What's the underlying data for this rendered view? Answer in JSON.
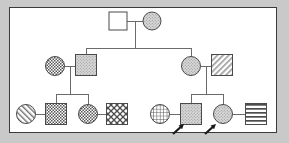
{
  "diagram": {
    "type": "pedigree-chart",
    "border_color": "#3a3a3a",
    "background_color": "#ffffff",
    "page_background": "#c9c9c9",
    "line_color": "#6b6b6b",
    "symbol_stroke": "#4a4a4a",
    "arrow_color": "#1a1a1a",
    "generations": 3,
    "legend_note": "",
    "symbols": [
      {
        "id": "I-1",
        "shape": "square",
        "sex": "male",
        "fill": "blank",
        "cx": 118,
        "cy": 21,
        "size": 18,
        "generation": 1,
        "proband": false
      },
      {
        "id": "I-2",
        "shape": "circle",
        "sex": "female",
        "fill": "stipple",
        "cx": 152,
        "cy": 21,
        "size": 18,
        "generation": 1,
        "proband": false
      },
      {
        "id": "II-1",
        "shape": "circle",
        "sex": "female",
        "fill": "checker-fine",
        "cx": 55,
        "cy": 66,
        "size": 19,
        "generation": 2,
        "proband": false
      },
      {
        "id": "II-2",
        "shape": "square",
        "sex": "male",
        "fill": "stipple",
        "cx": 86,
        "cy": 65,
        "size": 21,
        "generation": 2,
        "proband": false
      },
      {
        "id": "II-3",
        "shape": "circle",
        "sex": "female",
        "fill": "stipple",
        "cx": 191,
        "cy": 66,
        "size": 19,
        "generation": 2,
        "proband": false
      },
      {
        "id": "II-4",
        "shape": "square",
        "sex": "male",
        "fill": "diagonal",
        "cx": 222,
        "cy": 65,
        "size": 21,
        "generation": 2,
        "proband": false
      },
      {
        "id": "III-1",
        "shape": "circle",
        "sex": "female",
        "fill": "stripe-diag",
        "cx": 26,
        "cy": 114,
        "size": 19,
        "generation": 3,
        "proband": false
      },
      {
        "id": "III-2",
        "shape": "square",
        "sex": "male",
        "fill": "checker-fine",
        "cx": 56,
        "cy": 114,
        "size": 21,
        "generation": 3,
        "proband": false
      },
      {
        "id": "III-3",
        "shape": "circle",
        "sex": "female",
        "fill": "checker-fine",
        "cx": 88,
        "cy": 114,
        "size": 19,
        "generation": 3,
        "proband": false
      },
      {
        "id": "III-4",
        "shape": "square",
        "sex": "male",
        "fill": "cross-coarse",
        "cx": 117,
        "cy": 114,
        "size": 21,
        "generation": 3,
        "proband": false
      },
      {
        "id": "III-5",
        "shape": "circle",
        "sex": "female",
        "fill": "grid",
        "cx": 160,
        "cy": 114,
        "size": 19,
        "generation": 3,
        "proband": false
      },
      {
        "id": "III-6",
        "shape": "square",
        "sex": "male",
        "fill": "stipple",
        "cx": 191,
        "cy": 114,
        "size": 21,
        "generation": 3,
        "proband": true
      },
      {
        "id": "III-7",
        "shape": "circle",
        "sex": "female",
        "fill": "stipple",
        "cx": 223,
        "cy": 114,
        "size": 19,
        "generation": 3,
        "proband": true
      },
      {
        "id": "III-8",
        "shape": "square",
        "sex": "male",
        "fill": "stripe-horiz",
        "cx": 256,
        "cy": 114,
        "size": 21,
        "generation": 3,
        "proband": false
      }
    ],
    "mating_lines": [
      {
        "from": "I-1",
        "to": "I-2",
        "y": 21
      },
      {
        "from": "II-1",
        "to": "II-2",
        "y": 66
      },
      {
        "from": "II-3",
        "to": "II-4",
        "y": 66
      },
      {
        "from": "III-1",
        "to": "III-2",
        "y": 114
      },
      {
        "from": "III-3",
        "to": "III-4",
        "y": 114
      },
      {
        "from": "III-5",
        "to": "III-6",
        "y": 114
      },
      {
        "from": "III-7",
        "to": "III-8",
        "y": 114
      }
    ],
    "sibship_groups": [
      {
        "parents": [
          "I-1",
          "I-2"
        ],
        "drop_x": 135,
        "bar_y": 48,
        "children_x": [
          86,
          191
        ]
      },
      {
        "parents": [
          "II-1",
          "II-2"
        ],
        "drop_x": 70,
        "bar_y": 94,
        "children_x": [
          56,
          88
        ]
      },
      {
        "parents": [
          "II-3",
          "II-4"
        ],
        "drop_x": 206,
        "bar_y": 94,
        "children_x": [
          191,
          223
        ]
      }
    ],
    "proband_arrows": [
      {
        "target": "III-6",
        "tip_x": 184,
        "tip_y": 124,
        "tail_x": 173,
        "tail_y": 134
      },
      {
        "target": "III-7",
        "tip_x": 216,
        "tip_y": 124,
        "tail_x": 205,
        "tail_y": 134
      }
    ]
  }
}
